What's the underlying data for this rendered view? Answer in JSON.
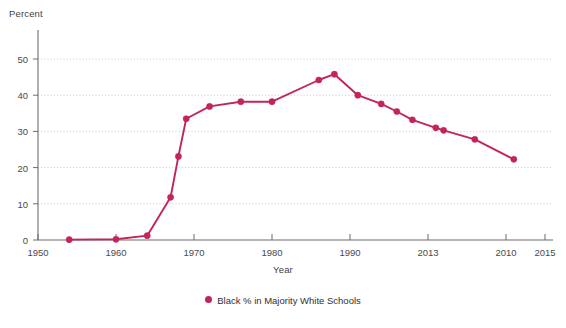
{
  "chart_data": {
    "type": "line",
    "title": "",
    "xlabel": "Year",
    "ylabel": "Percent",
    "xlim": [
      1950,
      2015
    ],
    "ylim": [
      0,
      55
    ],
    "grid": true,
    "legend_position": "bottom",
    "x_tick_labels": [
      "1950",
      "1960",
      "1970",
      "1980",
      "1990",
      "2013",
      "2010",
      "2015"
    ],
    "x_tick_values": [
      1950,
      1960,
      1970,
      1980,
      1990,
      2000,
      2010,
      2015
    ],
    "y_tick_labels": [
      "0",
      "10",
      "20",
      "30",
      "40",
      "50"
    ],
    "y_tick_values": [
      0,
      10,
      20,
      30,
      40,
      50
    ],
    "series": [
      {
        "name": "Black % in Majority White Schools",
        "color": "#c2255c",
        "marker": "circle",
        "x": [
          1954,
          1960,
          1964,
          1967,
          1968,
          1969,
          1972,
          1976,
          1980,
          1986,
          1988,
          1991,
          1994,
          1996,
          1998,
          2001,
          2002,
          2006,
          2011
        ],
        "values": [
          0.1,
          0.2,
          1.2,
          11.8,
          23.1,
          33.5,
          36.9,
          38.2,
          38.2,
          44.2,
          45.8,
          40.0,
          37.6,
          35.5,
          33.2,
          31.0,
          30.3,
          27.8,
          22.3
        ]
      }
    ]
  },
  "legend": {
    "entries": [
      {
        "label": "Black % in Majority White Schools",
        "color": "#c2255c"
      }
    ]
  },
  "axes": {
    "y_title": "Percent",
    "x_title": "Year"
  }
}
